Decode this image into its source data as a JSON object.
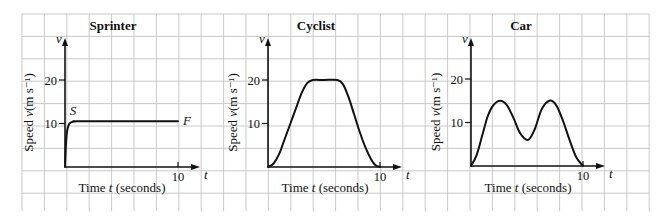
{
  "chart_data": [
    {
      "type": "line",
      "title": "Sprinter",
      "xlabel": "Time t (seconds)",
      "ylabel": "Speed v(m s⁻¹)",
      "x_axis_symbol": "t",
      "y_axis_symbol": "v",
      "x_ticks": [
        10
      ],
      "y_ticks": [
        10,
        20
      ],
      "xlim": [
        0,
        11
      ],
      "ylim": [
        0,
        27
      ],
      "annotations": [
        {
          "label": "S",
          "x": 0.5,
          "y": 10.5
        },
        {
          "label": "F",
          "x": 10,
          "y": 10.5
        }
      ],
      "series": [
        {
          "name": "Sprinter speed",
          "x": [
            0,
            0.1,
            0.2,
            0.35,
            0.5,
            0.7,
            1.0,
            1.5,
            10
          ],
          "y": [
            0,
            6,
            8.5,
            9.8,
            10.2,
            10.4,
            10.5,
            10.5,
            10.5
          ]
        }
      ]
    },
    {
      "type": "line",
      "title": "Cyclist",
      "xlabel": "Time t (seconds)",
      "ylabel": "Speed v(m s⁻¹)",
      "x_axis_symbol": "t",
      "y_axis_symbol": "v",
      "x_ticks": [
        10
      ],
      "y_ticks": [
        10,
        20
      ],
      "xlim": [
        0,
        11
      ],
      "ylim": [
        0,
        27
      ],
      "series": [
        {
          "name": "Cyclist speed",
          "x": [
            0,
            0.5,
            1,
            1.5,
            2,
            2.5,
            3,
            3.5,
            4,
            5,
            6.2,
            6.7,
            7.2,
            7.7,
            8.2,
            8.7,
            9.2,
            9.6,
            10
          ],
          "y": [
            0,
            0.8,
            3,
            6.5,
            10,
            13.5,
            17,
            19.3,
            20,
            20,
            20,
            19,
            16,
            12,
            8,
            4.5,
            1.8,
            0.4,
            0
          ]
        }
      ]
    },
    {
      "type": "line",
      "title": "Car",
      "xlabel": "Time t (seconds)",
      "ylabel": "Speed v(m s⁻¹)",
      "x_axis_symbol": "t",
      "y_axis_symbol": "v",
      "x_ticks": [
        10
      ],
      "y_ticks": [
        10,
        20
      ],
      "xlim": [
        0,
        11
      ],
      "ylim": [
        0,
        27
      ],
      "series": [
        {
          "name": "Car speed",
          "x": [
            0,
            0.5,
            1,
            1.5,
            2,
            2.6,
            3.2,
            3.8,
            4.4,
            5.1,
            5.7,
            6.3,
            7,
            7.6,
            8.2,
            8.8,
            9.4,
            10
          ],
          "y": [
            0,
            2.5,
            7,
            11.5,
            14,
            15,
            14,
            11,
            7.5,
            6,
            8.5,
            13,
            15,
            14,
            10.5,
            6,
            2,
            0
          ]
        }
      ]
    }
  ],
  "figure": {
    "grid_color": "#c9c9c9",
    "line_color": "#111111",
    "background": "#ffffff"
  }
}
